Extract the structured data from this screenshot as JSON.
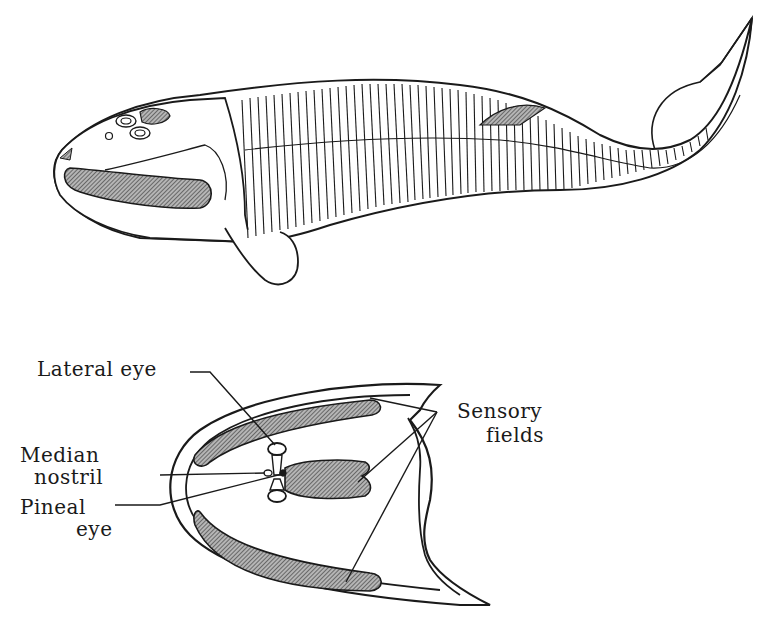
{
  "figure": {
    "top_view": {
      "description": "Lateral view of an ostracoderm (cephalaspid) fish with head shield, segmented trunk and heterocercal tail"
    },
    "bottom_view": {
      "description": "Dorsal view of head shield",
      "labels": {
        "lateral_eye": "Lateral eye",
        "median_nostril_line1": "Median",
        "median_nostril_line2": "nostril",
        "pineal_eye_line1": "Pineal",
        "pineal_eye_line2": "eye",
        "sensory_fields_line1": "Sensory",
        "sensory_fields_line2": "fields"
      }
    },
    "colors": {
      "line": "#1a1a1a",
      "hatch_fill": "#8a8a8a",
      "background": "#ffffff"
    }
  }
}
